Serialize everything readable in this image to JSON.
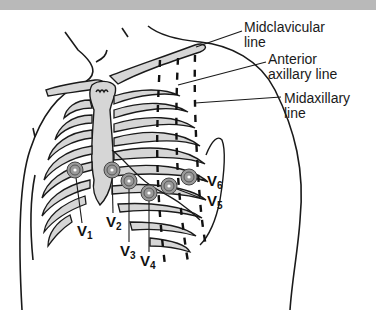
{
  "figure": {
    "colors": {
      "top_band": "#b9b9b9",
      "outline": "#1a1a1a",
      "bone_fill": "#d6d6d6",
      "electrode_ring": "#8a8a8a",
      "background": "#ffffff"
    }
  },
  "reference_lines": [
    {
      "label_line1": "Midclavicular",
      "label_line2": "line"
    },
    {
      "label_line1": "Anterior",
      "label_line2": "axillary line"
    },
    {
      "label_line1": "Midaxillary",
      "label_line2": "line"
    }
  ],
  "electrodes": [
    {
      "name": "V",
      "sub": "1"
    },
    {
      "name": "V",
      "sub": "2"
    },
    {
      "name": "V",
      "sub": "3"
    },
    {
      "name": "V",
      "sub": "4"
    },
    {
      "name": "V",
      "sub": "5"
    },
    {
      "name": "V",
      "sub": "6"
    }
  ]
}
